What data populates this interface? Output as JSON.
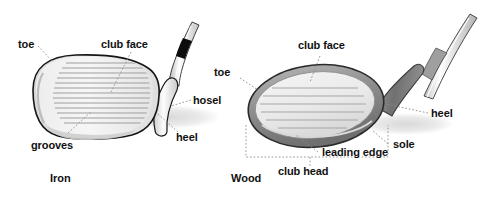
{
  "figure": {
    "background_color": "#ffffff",
    "text_color": "#111111",
    "leader_line_color": "#8a8a8a",
    "outline_color": "#1a1a1a",
    "body_fill": "#f0f0f0",
    "groove_color": "#a8a8a8",
    "wood_rim_color": "#8e8e8e",
    "shadow_color": "#e2e2e2",
    "ferrule_color": "#0d0d0d"
  },
  "iron": {
    "caption": "Iron",
    "labels": [
      {
        "id": "toe",
        "text": "toe"
      },
      {
        "id": "club-face",
        "text": "club face"
      },
      {
        "id": "hosel",
        "text": "hosel"
      },
      {
        "id": "heel",
        "text": "heel"
      },
      {
        "id": "grooves",
        "text": "grooves"
      }
    ]
  },
  "wood": {
    "caption": "Wood",
    "labels": [
      {
        "id": "club-face",
        "text": "club face"
      },
      {
        "id": "toe",
        "text": "toe"
      },
      {
        "id": "heel",
        "text": "heel"
      },
      {
        "id": "sole",
        "text": "sole"
      },
      {
        "id": "leading-edge",
        "text": "leading edge"
      },
      {
        "id": "club-head",
        "text": "club head"
      }
    ]
  }
}
